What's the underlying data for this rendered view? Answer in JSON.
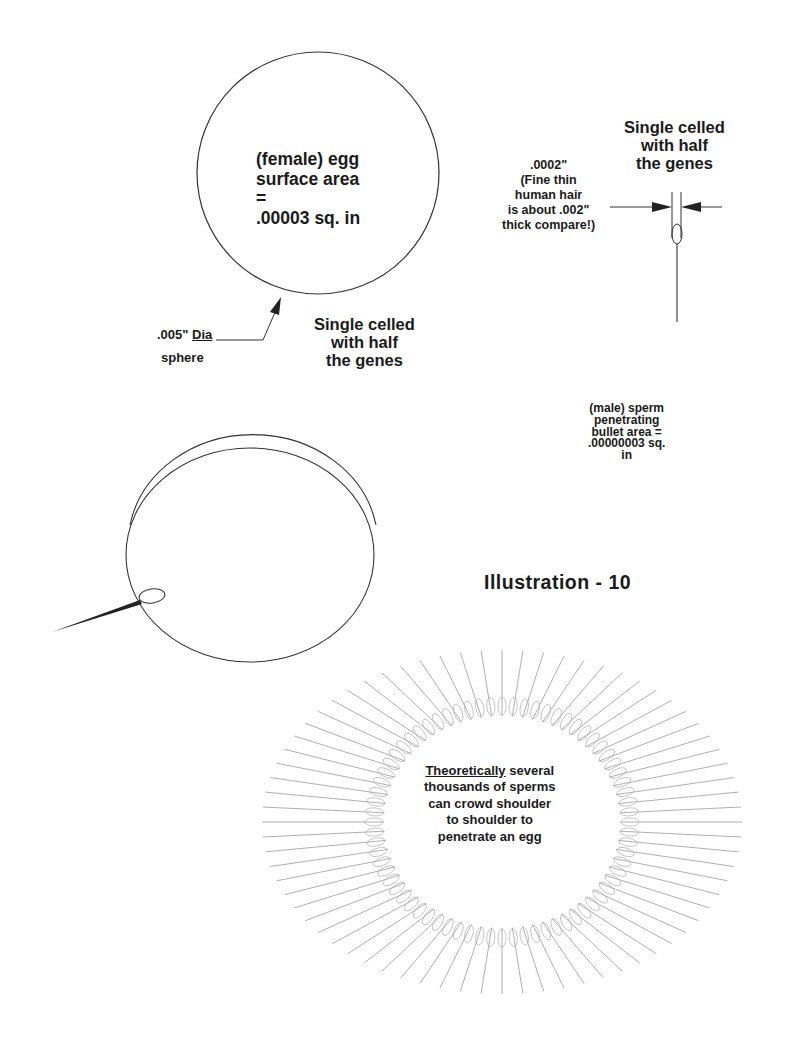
{
  "figure": {
    "title": "Illustration - 10",
    "colors": {
      "ink": "#1a1a1a",
      "background": "#ffffff",
      "ring_lines": "#9a9a9a"
    }
  },
  "egg": {
    "label_lines": [
      "(female) egg",
      "surface area",
      "=",
      ".00003 sq. in"
    ],
    "diameter_label": ".005\"",
    "diameter_label_underlined": "Dia",
    "diameter_label_line2": "sphere",
    "caption_lines": [
      "Single celled",
      "with half",
      "the genes"
    ]
  },
  "sperm": {
    "caption_lines": [
      "Single celled",
      "with half",
      "the genes"
    ],
    "width_label_lines": [
      ".0002\"",
      "(Fine thin",
      "human hair",
      "is about .002\"",
      "thick compare!)"
    ],
    "area_label_lines": [
      "(male) sperm",
      "penetrating",
      "bullet area =",
      ".00000003 sq.",
      "in"
    ]
  },
  "ring": {
    "note_underlined": "Theoretically",
    "note_first_rest": " several",
    "note_lines": [
      "thousands of sperms",
      "can crowd shoulder",
      "to shoulder to",
      "penetrate an egg"
    ]
  }
}
